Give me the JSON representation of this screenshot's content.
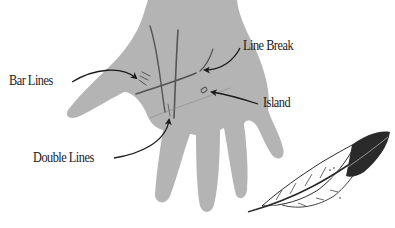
{
  "diagram": {
    "colors": {
      "hand": "#b4b4b4",
      "line": "#555555",
      "arrow": "#1a1a1a",
      "feather_dark": "#2a2a2a",
      "feather_light": "#ffffff"
    },
    "labels": [
      {
        "id": "bar_lines",
        "text": "Bar Lines"
      },
      {
        "id": "line_break",
        "text": "Line Break"
      },
      {
        "id": "island",
        "text": "Island"
      },
      {
        "id": "double_lines",
        "text": "Double Lines"
      }
    ],
    "decorations": [
      "feather-icon"
    ]
  }
}
